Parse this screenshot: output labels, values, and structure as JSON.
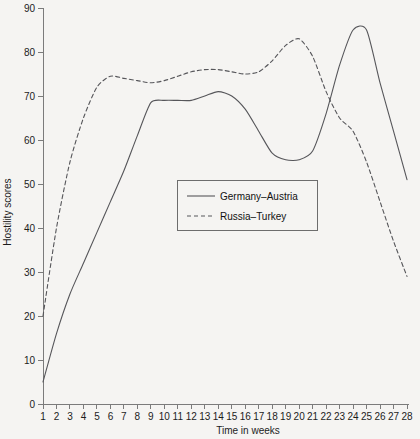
{
  "chart_data": {
    "type": "line",
    "title": "",
    "xlabel": "Time in weeks",
    "ylabel": "Hostility scores",
    "xlim": [
      1,
      28
    ],
    "ylim": [
      0,
      90
    ],
    "grid": false,
    "legend_position": "center",
    "x": [
      1,
      2,
      3,
      4,
      5,
      6,
      7,
      8,
      9,
      10,
      11,
      12,
      13,
      14,
      15,
      16,
      17,
      18,
      19,
      20,
      21,
      22,
      23,
      24,
      25,
      26,
      27,
      28
    ],
    "xticks": [
      "1",
      "2",
      "3",
      "4",
      "5",
      "6",
      "7",
      "8",
      "9",
      "10",
      "11",
      "12",
      "13",
      "14",
      "15",
      "16",
      "17",
      "18",
      "19",
      "20",
      "21",
      "22",
      "23",
      "24",
      "25",
      "26",
      "27",
      "28"
    ],
    "yticks": [
      "0",
      "10",
      "20",
      "30",
      "40",
      "50",
      "60",
      "70",
      "80",
      "90"
    ],
    "ytick_values": [
      0,
      10,
      20,
      30,
      40,
      50,
      60,
      70,
      80,
      90
    ],
    "series": [
      {
        "name": "Germany–Austria",
        "style": "solid",
        "values": [
          5,
          16,
          25,
          32,
          39,
          46,
          53,
          61,
          68.5,
          69,
          69,
          69,
          70,
          71,
          70,
          67,
          62,
          57,
          55.5,
          55.5,
          57.5,
          66,
          77,
          85,
          85,
          73,
          62,
          51
        ]
      },
      {
        "name": "Russia–Turkey",
        "style": "dashed",
        "values": [
          20,
          40,
          55,
          65,
          72,
          74.5,
          74,
          73.5,
          73,
          73.5,
          74.5,
          75.5,
          76,
          76,
          75.5,
          75,
          75.5,
          78,
          81.5,
          83,
          79,
          71,
          65,
          62,
          55,
          46,
          37,
          29
        ]
      }
    ]
  },
  "legend": {
    "entries": [
      {
        "label": "Germany–Austria",
        "style": "solid"
      },
      {
        "label": "Russia–Turkey",
        "style": "dashed"
      }
    ]
  }
}
